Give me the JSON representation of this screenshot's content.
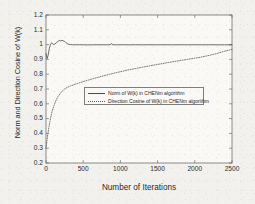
{
  "chart_data": {
    "type": "line",
    "title": "",
    "xlabel": "Number of Iterations",
    "ylabel": "Norm and Direction Cosine of W(k)",
    "xlim": [
      0,
      2500
    ],
    "ylim": [
      0.2,
      1.2
    ],
    "xticks": [
      "0",
      "500",
      "1000",
      "1500",
      "2000",
      "2500"
    ],
    "xtick_values": [
      0,
      500,
      1000,
      1500,
      2000,
      2500
    ],
    "yticks": [
      "0.2",
      "0.3",
      "0.4",
      "0.5",
      "0.6",
      "0.7",
      "0.8",
      "0.9",
      "1",
      "1.1",
      "1.2"
    ],
    "ytick_values": [
      0.2,
      0.3,
      0.4,
      0.5,
      0.6,
      0.7,
      0.8,
      0.9,
      1.0,
      1.1,
      1.2
    ],
    "grid": false,
    "legend_position": "center",
    "series": [
      {
        "name": "Norm of W(k) in CHENm algorithm",
        "style": "solid",
        "color": "#4a4a4a",
        "x": [
          0,
          15,
          30,
          45,
          60,
          75,
          90,
          105,
          120,
          140,
          160,
          180,
          200,
          215,
          230,
          250,
          270,
          290,
          310,
          330,
          360,
          400,
          450,
          500,
          560,
          620,
          700,
          780,
          860,
          880,
          900,
          960,
          1040,
          1120,
          1200,
          1300,
          1400,
          1500,
          1600,
          1700,
          1800,
          1900,
          2000,
          2100,
          2200,
          2300,
          2400,
          2500
        ],
        "y": [
          0.94,
          0.905,
          0.93,
          0.975,
          1.0,
          1.012,
          1.006,
          1.0,
          1.004,
          1.014,
          1.021,
          1.028,
          1.024,
          1.03,
          1.026,
          1.022,
          1.012,
          1.005,
          1.002,
          1.0,
          0.999,
          0.999,
          0.999,
          0.9985,
          0.998,
          0.9985,
          0.999,
          0.9985,
          0.999,
          1.006,
          0.999,
          0.9985,
          0.999,
          0.9985,
          0.999,
          0.9985,
          0.999,
          0.9985,
          0.999,
          0.9985,
          0.999,
          0.9985,
          0.999,
          0.9985,
          0.999,
          0.9985,
          0.9985,
          0.9985
        ]
      },
      {
        "name": "Direction Cosine of W(k) in CHENm algorithm",
        "style": "dotted",
        "color": "#5a5a5a",
        "x": [
          0,
          20,
          40,
          60,
          80,
          100,
          130,
          160,
          190,
          220,
          250,
          290,
          330,
          370,
          420,
          470,
          520,
          580,
          640,
          700,
          780,
          860,
          940,
          1020,
          1100,
          1200,
          1300,
          1400,
          1500,
          1600,
          1700,
          1800,
          1900,
          2000,
          2100,
          2200,
          2300,
          2400,
          2500
        ],
        "y": [
          0.3,
          0.38,
          0.445,
          0.5,
          0.545,
          0.578,
          0.618,
          0.648,
          0.67,
          0.687,
          0.7,
          0.712,
          0.721,
          0.728,
          0.737,
          0.745,
          0.753,
          0.762,
          0.771,
          0.779,
          0.79,
          0.8,
          0.81,
          0.819,
          0.828,
          0.838,
          0.848,
          0.857,
          0.866,
          0.875,
          0.884,
          0.892,
          0.9,
          0.908,
          0.917,
          0.928,
          0.94,
          0.955,
          0.968
        ]
      }
    ]
  },
  "axes": {
    "frame_color": "#5c5c5c"
  }
}
